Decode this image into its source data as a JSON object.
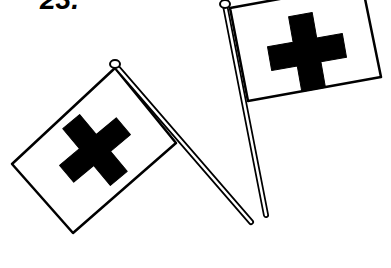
{
  "label": "23.",
  "illustration": {
    "description": "Two crossed flags with black crosses",
    "flags": [
      {
        "name": "left-flag",
        "emblem": "cross-icon"
      },
      {
        "name": "right-flag",
        "emblem": "cross-icon"
      }
    ],
    "colors": {
      "ink": "#000000",
      "paper": "#ffffff"
    }
  }
}
